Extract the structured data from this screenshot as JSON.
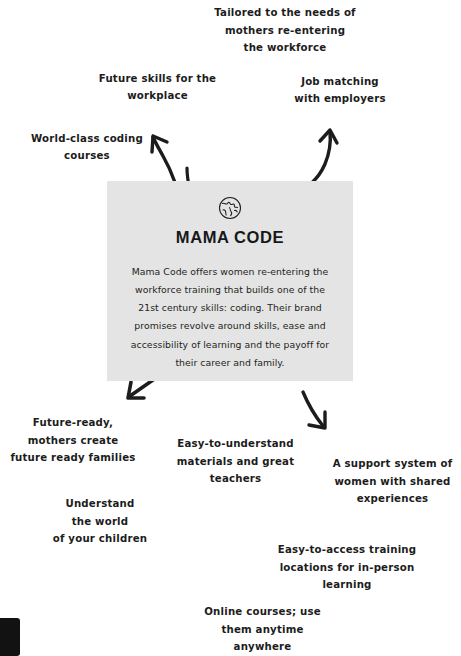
{
  "page": {
    "background_color": "#ffffff",
    "width": 461,
    "height": 656
  },
  "card": {
    "icon": "globe-icon",
    "title": "MAMA CODE",
    "body": "Mama Code offers women re-entering the workforce training that builds one of the 21st century skills: coding. Their brand promises revolve around skills, ease and accessibility of learning and the payoff for their career and family.",
    "background_color": "#e4e4e4",
    "text_color": "#1d1f21"
  },
  "notes": {
    "top_center": "Tailored to the needs of\nmothers re-entering\nthe workforce",
    "top_left": "Future skills for the\nworkplace",
    "top_right": "Job matching\nwith employers",
    "left_upper": "World-class coding\ncourses",
    "bottom_left": "Future-ready,\nmothers create\nfuture ready families",
    "bottom_left_lower": "Understand\nthe world\nof your children",
    "bottom_center": "Easy-to-understand\nmaterials and great\nteachers",
    "bottom_right": "A support system of\nwomen with shared\nexperiences",
    "bottom_right_lower": "Easy-to-access training\nlocations for in-person\nlearning",
    "bottom_center_lower": "Online courses; use\nthem anytime\nanywhere"
  },
  "arrows": {
    "color": "#1c1c1c",
    "items": [
      {
        "name": "arrow-to-top-left",
        "direction": "up-left"
      },
      {
        "name": "arrow-to-top-right",
        "direction": "up-right"
      },
      {
        "name": "arrow-to-card-top",
        "direction": "up"
      },
      {
        "name": "arrow-to-bottom-left",
        "direction": "down-left"
      },
      {
        "name": "arrow-to-bottom-right",
        "direction": "down-right"
      }
    ]
  }
}
